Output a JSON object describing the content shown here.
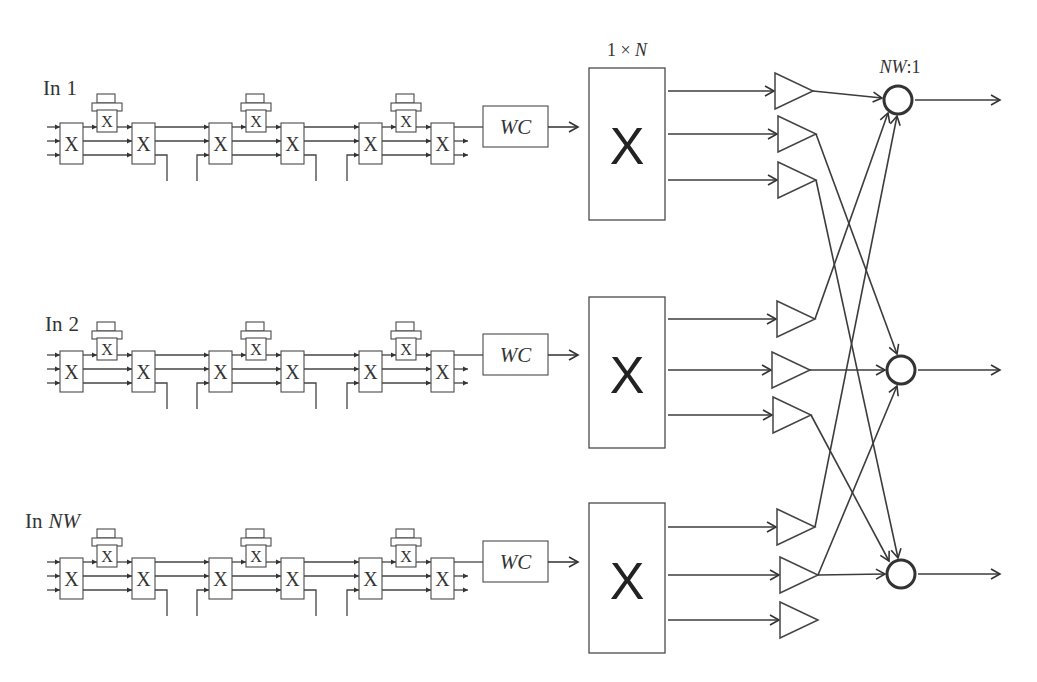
{
  "diagram": {
    "splitter_label": {
      "prefix": "1 × ",
      "variable": "N"
    },
    "combiner_label": {
      "variable": "NW",
      "suffix": ":1"
    },
    "switch_symbol": "X",
    "filter_symbol": "X",
    "space_switch_symbol": "X",
    "converter_label": "WC",
    "stages_per_input": 3,
    "outputs_per_splitter": 3,
    "combiner_count": 3,
    "inputs": [
      {
        "prefix": "In",
        "index": "1",
        "index_italic": false
      },
      {
        "prefix": "In",
        "index": "2",
        "index_italic": false
      },
      {
        "prefix": "In",
        "index": "NW",
        "index_italic": true
      }
    ],
    "connections": [
      {
        "input": 0,
        "amp": 0,
        "combiner": 0
      },
      {
        "input": 1,
        "amp": 0,
        "combiner": 0
      },
      {
        "input": 2,
        "amp": 0,
        "combiner": 0
      },
      {
        "input": 0,
        "amp": 1,
        "combiner": 1
      },
      {
        "input": 1,
        "amp": 1,
        "combiner": 1
      },
      {
        "input": 2,
        "amp": 1,
        "combiner": 1
      },
      {
        "input": 0,
        "amp": 2,
        "combiner": 2
      },
      {
        "input": 1,
        "amp": 2,
        "combiner": 2
      },
      {
        "input": 2,
        "amp": 1,
        "combiner": 2
      }
    ],
    "colors": {
      "line": "#3c3c3c",
      "background": "#ffffff"
    }
  }
}
